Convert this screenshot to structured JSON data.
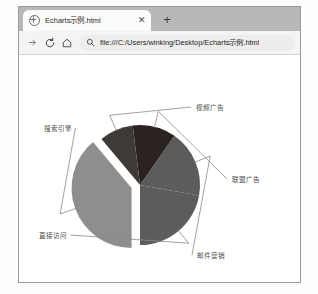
{
  "window": {
    "tab": {
      "title": "Echarts示例.html",
      "favicon": "globe-icon",
      "close_label": "✕"
    },
    "new_tab_label": "+",
    "toolbar": {
      "forward_icon": "forward-arrow-icon",
      "reload_icon": "reload-icon",
      "home_icon": "home-icon",
      "search_icon": "search-icon",
      "url": "file:///C:/Users/winking/Desktop/Echarts示例.html"
    }
  },
  "colors": {
    "page_background": "#ffffff",
    "tab_strip": "#b8b8b8",
    "toolbar": "#f4f4f4",
    "omnibox": "#ededed",
    "window_border": "#9a9a9a",
    "label_text": "#4a4a4a",
    "leader_line": "#8a8a8a",
    "slice_search_engine": "#8e8e8e",
    "slice_direct_visit": "#5c5c5c",
    "slice_email_marketing": "#5c5c5c",
    "slice_affiliate_ads": "#2b2320",
    "slice_video_ads": "#3f3a38"
  },
  "chart_data": {
    "type": "pie",
    "title": "",
    "subtitle": "",
    "xlabel": "",
    "ylabel": "",
    "legend_position": "none",
    "grid": false,
    "center": [
      140,
      185
    ],
    "radius": 60,
    "categories": [
      "搜索引擎",
      "直接访问",
      "邮件营销",
      "联盟广告",
      "视频广告"
    ],
    "values": [
      1048,
      580,
      484,
      300,
      300
    ],
    "slices": [
      {
        "name": "搜索引擎",
        "value": 1048,
        "color": "#8e8e8e",
        "start_angle": 180,
        "end_angle": 320,
        "exploded": true,
        "label_x": 44,
        "label_y": 131,
        "label_anchor": "start"
      },
      {
        "name": "直接访问",
        "value": 580,
        "color": "#5c5c5c",
        "start_angle": 100,
        "end_angle": 180,
        "exploded": false,
        "label_x": 39,
        "label_y": 238,
        "label_anchor": "start"
      },
      {
        "name": "邮件营销",
        "value": 484,
        "color": "#5c5c5c",
        "start_angle": 35,
        "end_angle": 100,
        "exploded": false,
        "label_x": 197,
        "label_y": 258,
        "label_anchor": "start"
      },
      {
        "name": "联盟广告",
        "value": 300,
        "color": "#2b2320",
        "start_angle": 353,
        "end_angle": 35,
        "exploded": false,
        "label_x": 232,
        "label_y": 182,
        "label_anchor": "start"
      },
      {
        "name": "视频广告",
        "value": 300,
        "color": "#3f3a38",
        "start_angle": 320,
        "end_angle": 353,
        "exploded": false,
        "label_x": 196,
        "label_y": 110,
        "label_anchor": "start"
      }
    ]
  }
}
